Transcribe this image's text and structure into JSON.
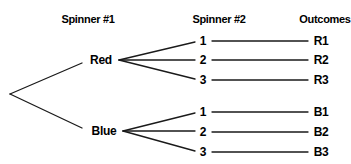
{
  "headers": {
    "col1": "Spinner #1",
    "col2": "Spinner #2",
    "col3": "Outcomes"
  },
  "spinner1": [
    {
      "label": "Red"
    },
    {
      "label": "Blue"
    }
  ],
  "spinner2": {
    "red": [
      "1",
      "2",
      "3"
    ],
    "blue": [
      "1",
      "2",
      "3"
    ]
  },
  "outcomes": {
    "red": [
      "R1",
      "R2",
      "R3"
    ],
    "blue": [
      "B1",
      "B2",
      "B3"
    ]
  },
  "colors": {
    "line": "#1a1a1a",
    "text": "#000000",
    "background": "#ffffff"
  }
}
